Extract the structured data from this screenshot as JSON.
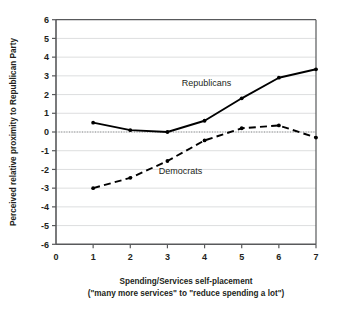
{
  "chart_data": {
    "type": "line",
    "title": "",
    "xlabel": "Spending/Services self-placement",
    "xlabel_sub": "(\"many more services\" to \"reduce spending a lot\")",
    "ylabel": "Perceived relative proximity to Republican Party",
    "x": [
      1,
      2,
      3,
      4,
      5,
      6,
      7
    ],
    "xlim": [
      0,
      7
    ],
    "ylim": [
      -6,
      6
    ],
    "xticks": [
      0,
      1,
      2,
      3,
      4,
      5,
      6,
      7
    ],
    "xtick_labels": [
      "0",
      "1",
      "2",
      "3",
      "4",
      "5",
      "6",
      "7"
    ],
    "yticks": [
      -6,
      -5,
      -4,
      -3,
      -2,
      -1,
      0,
      1,
      2,
      3,
      4,
      5,
      6
    ],
    "ytick_labels": [
      "-6",
      "-5",
      "-4",
      "-3",
      "-2",
      "-1",
      "0",
      "1",
      "2",
      "3",
      "4",
      "5",
      "6"
    ],
    "grid": true,
    "legend": "inline-annotations",
    "zero_reference_line": 0,
    "series": [
      {
        "name": "Republicans",
        "style": "solid",
        "color": "#000000",
        "marker": "dot",
        "values": [
          0.5,
          0.1,
          0.0,
          0.6,
          1.8,
          2.9,
          3.35
        ]
      },
      {
        "name": "Democrats",
        "style": "dashed",
        "color": "#000000",
        "marker": "dot",
        "values": [
          -3.0,
          -2.45,
          -1.55,
          -0.45,
          0.2,
          0.35,
          -0.3
        ]
      }
    ],
    "annotations": [
      {
        "text": "Republicans",
        "x": 4.05,
        "y": 2.45
      },
      {
        "text": "Democrats",
        "x": 3.35,
        "y": -2.25
      }
    ]
  },
  "colors": {
    "axis": "#58595b",
    "grid": "#d9dadb",
    "line": "#000000",
    "text": "#231f20",
    "background": "#ffffff"
  }
}
